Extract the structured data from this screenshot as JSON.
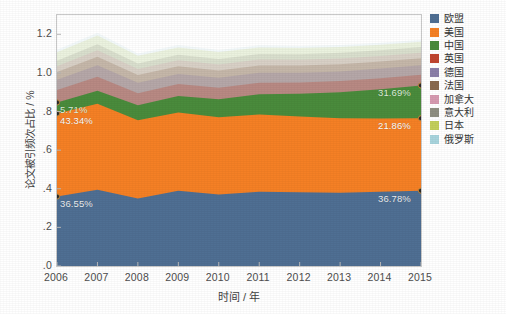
{
  "chart_data": {
    "type": "area",
    "stacked": true,
    "title": "",
    "xlabel": "时间 / 年",
    "ylabel": "论文被引频次占比 / %",
    "categories": [
      "2006",
      "2007",
      "2008",
      "2009",
      "2010",
      "2011",
      "2012",
      "2013",
      "2014",
      "2015"
    ],
    "xlim": [
      2006,
      2015
    ],
    "ylim": [
      0.0,
      1.3
    ],
    "yticks": [
      "1.2",
      "1.0",
      ".8",
      ".6",
      ".4",
      ".2",
      ".0"
    ],
    "ytick_values": [
      1.2,
      1.0,
      0.8,
      0.6,
      0.4,
      0.2,
      0.0
    ],
    "grid": false,
    "legend_position": "right",
    "series": [
      {
        "name": "欧盟",
        "color": "#4f6f93",
        "values": [
          0.36,
          0.395,
          0.35,
          0.39,
          0.37,
          0.385,
          0.382,
          0.38,
          0.384,
          0.39
        ]
      },
      {
        "name": "美国",
        "color": "#f58025",
        "values": [
          0.43,
          0.445,
          0.405,
          0.405,
          0.4,
          0.4,
          0.392,
          0.385,
          0.38,
          0.375
        ]
      },
      {
        "name": "中国",
        "color": "#4a8b3c",
        "values": [
          0.057,
          0.068,
          0.078,
          0.085,
          0.093,
          0.105,
          0.118,
          0.135,
          0.152,
          0.17
        ]
      },
      {
        "name": "英国",
        "color": "#c0452f",
        "values": [
          0.064,
          0.072,
          0.062,
          0.062,
          0.06,
          0.059,
          0.058,
          0.058,
          0.057,
          0.056
        ]
      },
      {
        "name": "德国",
        "color": "#8b7fa8",
        "values": [
          0.054,
          0.06,
          0.054,
          0.053,
          0.052,
          0.052,
          0.051,
          0.05,
          0.05,
          0.049
        ]
      },
      {
        "name": "法国",
        "color": "#8a6a4f",
        "values": [
          0.04,
          0.044,
          0.04,
          0.039,
          0.038,
          0.038,
          0.037,
          0.037,
          0.036,
          0.036
        ]
      },
      {
        "name": "加拿大",
        "color": "#d69ab0",
        "values": [
          0.03,
          0.033,
          0.031,
          0.031,
          0.03,
          0.03,
          0.03,
          0.03,
          0.029,
          0.029
        ]
      },
      {
        "name": "意大利",
        "color": "#8f8f82",
        "values": [
          0.028,
          0.031,
          0.029,
          0.029,
          0.029,
          0.029,
          0.029,
          0.029,
          0.029,
          0.029
        ]
      },
      {
        "name": "日本",
        "color": "#c3cf5a",
        "values": [
          0.044,
          0.046,
          0.04,
          0.038,
          0.036,
          0.034,
          0.032,
          0.03,
          0.029,
          0.028
        ]
      },
      {
        "name": "俄罗斯",
        "color": "#a8d4dd",
        "values": [
          0.013,
          0.014,
          0.012,
          0.012,
          0.011,
          0.011,
          0.01,
          0.01,
          0.01,
          0.01
        ]
      }
    ],
    "annotations": [
      {
        "text": "36.55%",
        "series": "欧盟",
        "year": "2006",
        "align": "left"
      },
      {
        "text": "36.78%",
        "series": "欧盟",
        "year": "2015",
        "align": "right"
      },
      {
        "text": "43.34%",
        "series": "美国",
        "year": "2006",
        "align": "left"
      },
      {
        "text": "21.86%",
        "series": "美国",
        "year": "2015",
        "align": "right"
      },
      {
        "text": "5.71%",
        "series": "中国",
        "year": "2006",
        "align": "left"
      },
      {
        "text": "31.69%",
        "series": "中国",
        "year": "2015",
        "align": "right"
      }
    ],
    "marker_points": [
      {
        "year": "2006",
        "label": "36.55%"
      },
      {
        "year": "2006",
        "label": "43.34%"
      },
      {
        "year": "2006",
        "label": "5.71%"
      },
      {
        "year": "2015",
        "label": "36.78%"
      },
      {
        "year": "2015",
        "label": "21.86%"
      },
      {
        "year": "2015",
        "label": "31.69%"
      }
    ]
  },
  "axes": {
    "xlabel": "时间 / 年",
    "ylabel": "论文被引频次占比 / %",
    "xticks": [
      "2006",
      "2007",
      "2008",
      "2009",
      "2010",
      "2011",
      "2012",
      "2013",
      "2014",
      "2015"
    ],
    "yticks": [
      "1.2",
      "1.0",
      ".8",
      ".6",
      ".4",
      ".2",
      ".0"
    ]
  },
  "legend": {
    "items": [
      {
        "label": "欧盟",
        "color": "#4f6f93"
      },
      {
        "label": "美国",
        "color": "#f58025"
      },
      {
        "label": "中国",
        "color": "#4a8b3c"
      },
      {
        "label": "英国",
        "color": "#c0452f"
      },
      {
        "label": "德国",
        "color": "#8b7fa8"
      },
      {
        "label": "法国",
        "color": "#8a6a4f"
      },
      {
        "label": "加拿大",
        "color": "#d69ab0"
      },
      {
        "label": "意大利",
        "color": "#8f8f82"
      },
      {
        "label": "日本",
        "color": "#c3cf5a"
      },
      {
        "label": "俄罗斯",
        "color": "#a8d4dd"
      }
    ]
  },
  "annotations": {
    "eu_start": "36.55%",
    "eu_end": "36.78%",
    "us_start": "43.34%",
    "us_end": "21.86%",
    "cn_start": "5.71%",
    "cn_end": "31.69%"
  }
}
